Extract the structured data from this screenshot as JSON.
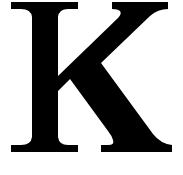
{
  "image": {
    "kind": "glyph-image",
    "description": "Serif capital letter K",
    "width": 183,
    "height": 175,
    "background_color": "#ffffff",
    "foreground_color": "#000000"
  },
  "glyph": {
    "character": "K",
    "name": "latin-capital-letter-k",
    "style": "serif-roman",
    "weight": "regular",
    "color": "#000000",
    "cap_top_y": 2,
    "baseline_y": 152,
    "stem_left_x": 33,
    "stem_right_x": 57,
    "top_left_serif_x1": 11,
    "top_left_serif_x2": 78,
    "foot_left_serif_x1": 11,
    "foot_left_serif_x2": 78,
    "top_arm_serif_x1": 112,
    "top_arm_serif_x2": 168,
    "foot_right_serif_x1": 101,
    "foot_right_serif_x2": 172,
    "vertex_x": 70,
    "vertex_y": 85,
    "path": "M 11 2 L 78 2 L 78 9 L 68 9 Q 59 9 58 17 L 58 76 L 118 18 Q 122 14 120 11 Q 118 9 112 9 L 112 2 L 168 2 L 168 9 Q 158 9 150 16 L 101 63 L 153 134 Q 161 144 172 145 L 172 152 L 101 152 L 101 145 L 108 145 Q 115 145 113 140 Q 112 136 108 131 L 70 79 L 58 91 L 58 137 Q 59 145 68 145 L 78 145 L 78 152 L 11 152 L 11 145 L 21 145 Q 31 145 32 137 L 32 17 Q 31 9 21 9 L 11 9 Z"
  }
}
